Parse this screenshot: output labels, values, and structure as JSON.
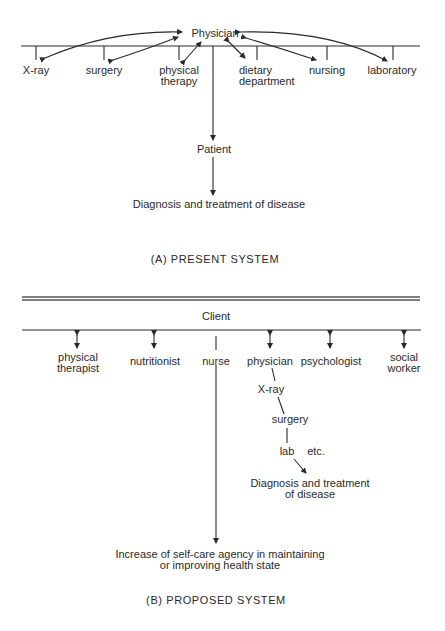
{
  "present_system": {
    "hub": "Physician",
    "departments": [
      {
        "label": "X-ray"
      },
      {
        "label": "surgery"
      },
      {
        "label": "physical therapy",
        "line1": "physical",
        "line2": "therapy"
      },
      {
        "label": "dietary department",
        "line1": "dietary",
        "line2": "department"
      },
      {
        "label": "nursing"
      },
      {
        "label": "laboratory"
      }
    ],
    "recipient": "Patient",
    "outcome": "Diagnosis and treatment of disease",
    "caption": "(A)  PRESENT  SYSTEM"
  },
  "proposed_system": {
    "hub": "Client",
    "providers": [
      {
        "label": "physical therapist",
        "line1": "physical",
        "line2": "therapist"
      },
      {
        "label": "nutritionist"
      },
      {
        "label": "nurse"
      },
      {
        "label": "physician"
      },
      {
        "label": "psychologist"
      },
      {
        "label": "social worker",
        "line1": "social",
        "line2": "worker"
      }
    ],
    "physician_chain": [
      "X-ray",
      "surgery",
      "lab",
      "etc."
    ],
    "physician_outcome": {
      "line1": "Diagnosis and treatment",
      "line2": "of disease"
    },
    "nurse_outcome": {
      "line1": "Increase of self-care agency in maintaining",
      "line2": "or improving health state"
    },
    "caption": "(B)  PROPOSED  SYSTEM"
  },
  "colors": {
    "ink": "#2a2a2a",
    "divider": "#555555",
    "background": "#ffffff"
  }
}
